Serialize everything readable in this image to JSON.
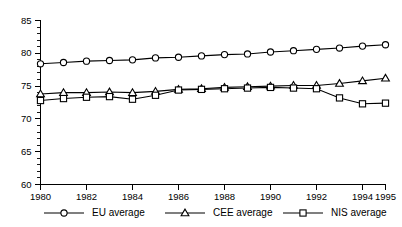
{
  "chart_data": {
    "type": "line",
    "title": "",
    "xlabel": "",
    "ylabel": "",
    "xlim": [
      1980,
      1995
    ],
    "ylim": [
      60,
      85
    ],
    "grid": false,
    "legend_position": "bottom",
    "x": [
      1980,
      1981,
      1982,
      1983,
      1984,
      1985,
      1986,
      1987,
      1988,
      1989,
      1990,
      1991,
      1992,
      1993,
      1994,
      1995
    ],
    "y_ticks": [
      60,
      65,
      70,
      75,
      80,
      85
    ],
    "y_tick_labels": [
      "60",
      "65",
      "70",
      "75",
      "80",
      "85"
    ],
    "x_ticks": [
      1980,
      1982,
      1984,
      1986,
      1988,
      1990,
      1992,
      1994,
      1995
    ],
    "x_tick_labels": [
      "1980",
      "1982",
      "1984",
      "1986",
      "1988",
      "1990",
      "1992",
      "1994",
      "1995"
    ],
    "series": [
      {
        "name": "EU average",
        "marker": "circle",
        "color": "#000000",
        "values": [
          78.4,
          78.6,
          78.8,
          78.9,
          79.0,
          79.3,
          79.4,
          79.6,
          79.8,
          79.9,
          80.2,
          80.4,
          80.6,
          80.8,
          81.1,
          81.3
        ]
      },
      {
        "name": "CEE average",
        "marker": "triangle",
        "color": "#000000",
        "values": [
          73.8,
          74.0,
          74.0,
          74.1,
          74.0,
          74.2,
          74.5,
          74.6,
          74.8,
          74.9,
          75.0,
          75.1,
          75.1,
          75.4,
          75.8,
          76.2
        ]
      },
      {
        "name": "NIS average",
        "marker": "square",
        "color": "#000000",
        "values": [
          72.8,
          73.1,
          73.3,
          73.4,
          73.0,
          73.6,
          74.4,
          74.5,
          74.6,
          74.7,
          74.8,
          74.7,
          74.6,
          73.2,
          72.3,
          72.4
        ]
      }
    ]
  },
  "legend": {
    "items": [
      {
        "label": "EU average",
        "marker": "circle-marker"
      },
      {
        "label": "CEE average",
        "marker": "triangle-marker"
      },
      {
        "label": "NIS average",
        "marker": "square-marker"
      }
    ]
  }
}
